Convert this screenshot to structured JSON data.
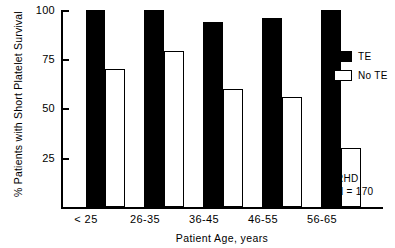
{
  "chart_data": {
    "type": "bar",
    "title": "",
    "xlabel": "Patient Age, years",
    "ylabel": "% Patients with Short Platelet Survival",
    "categories": [
      "< 25",
      "26-35",
      "36-45",
      "46-55",
      "56-65"
    ],
    "series": [
      {
        "name": "TE",
        "color": "#000000",
        "fill": "solid",
        "values": [
          100,
          100,
          94,
          96,
          100
        ]
      },
      {
        "name": "No TE",
        "color": "#ffffff",
        "fill": "open",
        "values": [
          70,
          79,
          60,
          56,
          30
        ]
      }
    ],
    "ylim": [
      0,
      100
    ],
    "yticks": [
      25,
      50,
      75,
      100
    ],
    "ytick_labels": [
      "25",
      "50",
      "75",
      "100"
    ],
    "grid": false,
    "legend_position": "upper right",
    "annotations": [
      "RHD",
      "N = 170"
    ]
  },
  "axes": {
    "y_title": "% Patients with Short Platelet Survival",
    "x_title": "Patient Age, years",
    "y_ticks": [
      {
        "label": "100",
        "value": 100
      },
      {
        "label": "75",
        "value": 75
      },
      {
        "label": "50",
        "value": 50
      },
      {
        "label": "25",
        "value": 25
      }
    ],
    "x_ticks": [
      "< 25",
      "26-35",
      "36-45",
      "46-55",
      "56-65"
    ]
  },
  "legend": {
    "items": [
      {
        "label": "TE",
        "style": "filled"
      },
      {
        "label": "No TE",
        "style": "open"
      }
    ]
  },
  "annotation": {
    "line1": "RHD",
    "line2": "N = 170"
  }
}
